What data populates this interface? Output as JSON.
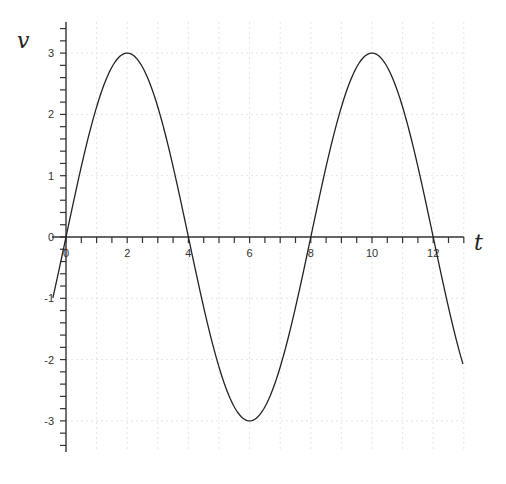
{
  "chart_data": {
    "type": "line",
    "title": "",
    "xlabel": "t",
    "ylabel": "v",
    "xlim": [
      -0.45,
      13
    ],
    "ylim": [
      -3.5,
      3.5
    ],
    "x_ticks": [
      0,
      2,
      4,
      6,
      8,
      10,
      12
    ],
    "x_tick_labels": [
      "0",
      "2",
      "4",
      "6",
      "8",
      "10",
      "12"
    ],
    "y_ticks": [
      -3,
      -2,
      -1,
      0,
      1,
      2,
      3
    ],
    "y_tick_labels": [
      "-3",
      "-2",
      "-1",
      "0",
      "1",
      "2",
      "3"
    ],
    "grid": true,
    "legend": null,
    "series": [
      {
        "name": "v(t)",
        "function": "v = 3 sin(pi t / 4)",
        "x": [
          -0.43,
          0,
          1,
          2,
          3,
          4,
          5,
          6,
          7,
          8,
          9,
          10,
          11,
          12,
          13
        ],
        "values": [
          -1.0,
          0,
          2.12,
          3,
          2.12,
          0,
          -2.12,
          -3,
          -2.12,
          0,
          2.12,
          3,
          2.12,
          0,
          -2.12
        ]
      }
    ],
    "color": "#222222"
  }
}
